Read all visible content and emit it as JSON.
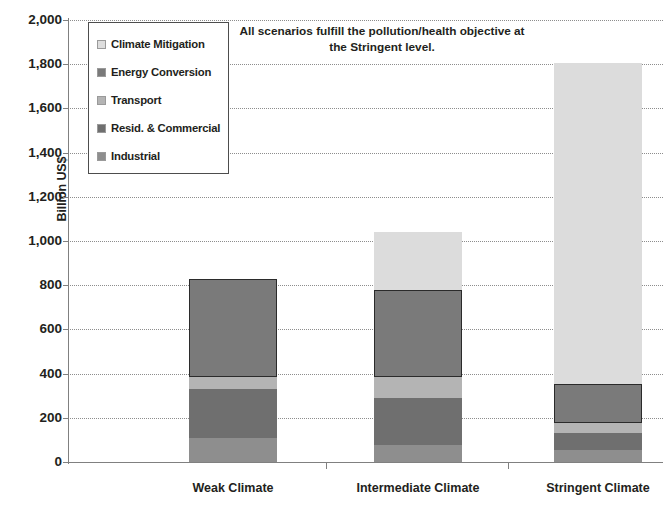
{
  "chart_data": {
    "type": "bar",
    "subtype": "stacked-column",
    "title": "",
    "annotation": "All scenarios fulfill the pollution/health objective at the Stringent level.",
    "xlabel": "",
    "ylabel": "Billion US$",
    "ylim": [
      0,
      2000
    ],
    "ytick_step": 200,
    "ytick_labels": [
      "2,000",
      "1,800",
      "1,600",
      "1,400",
      "1,200",
      "1,000",
      "800",
      "600",
      "400",
      "200",
      "0"
    ],
    "ytick_values": [
      2000,
      1800,
      1600,
      1400,
      1200,
      1000,
      800,
      600,
      400,
      200,
      0
    ],
    "grid": "horizontal-dotted",
    "legend_position": "upper-left-inside",
    "categories": [
      "Weak Climate",
      "Intermediate Climate",
      "Stringent Climate"
    ],
    "stack_order_bottom_to_top": [
      "Industrial",
      "Resid. & Commercial",
      "Transport",
      "Energy Conversion",
      "Climate Mitigation"
    ],
    "series": [
      {
        "name": "Industrial",
        "color": "#8e8e8e",
        "values": [
          110,
          75,
          55
        ]
      },
      {
        "name": "Resid. & Commercial",
        "color": "#6f6f6f",
        "values": [
          220,
          215,
          75
        ]
      },
      {
        "name": "Transport",
        "color": "#b4b4b4",
        "values": [
          55,
          95,
          45
        ]
      },
      {
        "name": "Energy Conversion",
        "color": "#7a7a7a",
        "values": [
          445,
          395,
          180
        ]
      },
      {
        "name": "Climate Mitigation",
        "color": "#dcdcdc",
        "values": [
          0,
          260,
          1450
        ]
      }
    ],
    "totals": [
      830,
      1040,
      1805
    ]
  },
  "legend": {
    "items": [
      {
        "label": "Climate Mitigation",
        "color": "#dddddd"
      },
      {
        "label": "Energy Conversion",
        "color": "#7a7a7a"
      },
      {
        "label": "Transport",
        "color": "#b4b4b4"
      },
      {
        "label": "Resid. & Commercial",
        "color": "#6f6f6f"
      },
      {
        "label": "Industrial",
        "color": "#8e8e8e"
      }
    ]
  },
  "axis": {
    "y_title": "Billion US$"
  },
  "colors": {
    "axis": "#808080",
    "grid": "#8d8d8d",
    "text": "#231f20",
    "outline": "#2b2b2b"
  }
}
